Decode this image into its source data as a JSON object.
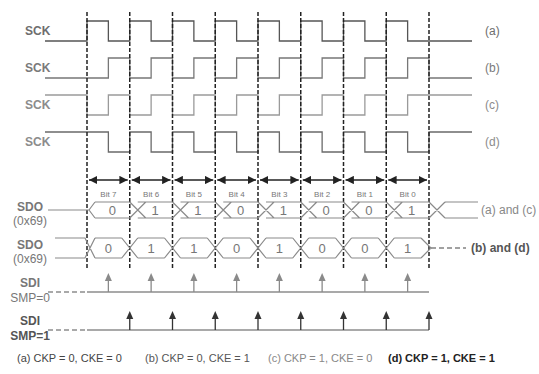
{
  "colors": {
    "sck_a": "#555555",
    "sck_b": "#777777",
    "sck_c": "#9a9a9a",
    "sck_d": "#6a6a6a",
    "label_a": "#6e6e6e",
    "label_b": "#7a7a7a",
    "label_c": "#8c8c8c",
    "label_d": "#8c8c8c",
    "sdo": "#8a8a8a",
    "sdo_text": "#777777",
    "arrow_smp0": "#8a8a8a",
    "arrow_smp1": "#333333",
    "guide": "#222222",
    "caption_a": "#444444",
    "caption_b": "#555555",
    "caption_c": "#888888",
    "caption_d": "#222222"
  },
  "timing": {
    "x_start": 87,
    "period": 42.75,
    "bit_count": 8
  },
  "sck_rows": [
    {
      "id": "a",
      "label": "SCK",
      "tag": "(a)",
      "high": 21,
      "low": 41,
      "idle": "low",
      "first_edge": "rise"
    },
    {
      "id": "b",
      "label": "SCK",
      "tag": "(b)",
      "high": 58,
      "low": 78,
      "idle": "low",
      "first_edge": "rise_mid"
    },
    {
      "id": "c",
      "label": "SCK",
      "tag": "(c)",
      "high": 95,
      "low": 115,
      "idle": "high",
      "first_edge": "fall"
    },
    {
      "id": "d",
      "label": "SCK",
      "tag": "(d)",
      "high": 132,
      "low": 152,
      "idle": "high",
      "first_edge": "fall_mid"
    }
  ],
  "bits": [
    "Bit 7",
    "Bit 6",
    "Bit 5",
    "Bit 4",
    "Bit 3",
    "Bit 2",
    "Bit 1",
    "Bit 0"
  ],
  "sdo_rows": [
    {
      "label": "SDO",
      "sublabel": "(0x69)",
      "tag": "(a) and (c)",
      "values": [
        "0",
        "1",
        "1",
        "0",
        "1",
        "0",
        "0",
        "1"
      ],
      "top": 202,
      "bottom": 218
    },
    {
      "label": "SDO",
      "sublabel": "(0x69)",
      "tag": "(b) and (d)",
      "values": [
        "0",
        "1",
        "1",
        "0",
        "1",
        "0",
        "0",
        "1"
      ],
      "top": 238,
      "bottom": 258
    }
  ],
  "sdi_rows": [
    {
      "label": "SDI",
      "sublabel": "SMP=0",
      "line_y": 292,
      "sample": "mid"
    },
    {
      "label": "SDI",
      "sublabel": "SMP=1",
      "line_y": 330,
      "sample": "end"
    }
  ],
  "captions": [
    {
      "text": "(a) CKP = 0, CKE = 0",
      "x": 17
    },
    {
      "text": "(b) CKP = 0, CKE = 1",
      "x": 145
    },
    {
      "text": "(c) CKP = 1, CKE = 0",
      "x": 268
    },
    {
      "text": "(d) CKP = 1, CKE = 1",
      "x": 388
    }
  ]
}
